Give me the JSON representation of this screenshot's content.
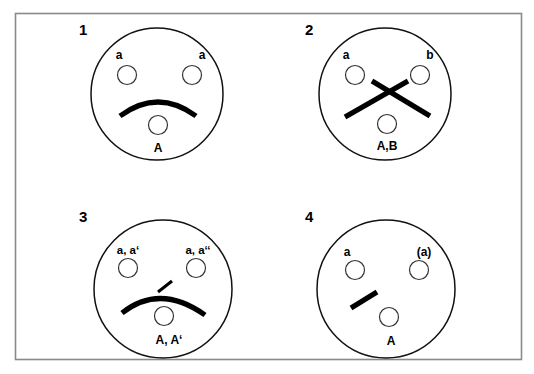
{
  "figure": {
    "background_color": "#ffffff",
    "frame_color": "#8a8a8a",
    "ink_color": "#000000"
  },
  "panels": [
    {
      "number": "1",
      "top_left_label": "a",
      "top_right_label": "a",
      "bottom_label": "A",
      "figure_type": "arc"
    },
    {
      "number": "2",
      "top_left_label": "a",
      "top_right_label": "b",
      "bottom_label": "A,B",
      "figure_type": "cross"
    },
    {
      "number": "3",
      "top_left_label": "a, a‘",
      "top_right_label": "a, a‘‘",
      "bottom_label": "A, A‘",
      "figure_type": "arc-with-spur"
    },
    {
      "number": "4",
      "top_left_label": "a",
      "top_right_label": "(a)",
      "bottom_label": "A",
      "figure_type": "short-segment"
    }
  ]
}
